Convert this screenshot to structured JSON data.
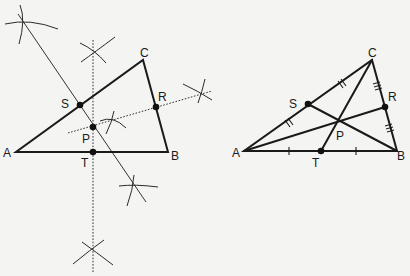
{
  "figures": [
    {
      "id": "left",
      "description": "Circumcenter construction via perpendicular bisectors",
      "labels": {
        "A": "A",
        "B": "B",
        "C": "C",
        "S": "S",
        "R": "R",
        "P": "P",
        "T": "T"
      }
    },
    {
      "id": "right",
      "description": "Centroid construction via medians",
      "labels": {
        "A": "A",
        "B": "B",
        "C": "C",
        "S": "S",
        "R": "R",
        "P": "P",
        "T": "T"
      }
    }
  ],
  "colors": {
    "ink": "#1a1a1a",
    "background": "#f4f4f2"
  }
}
